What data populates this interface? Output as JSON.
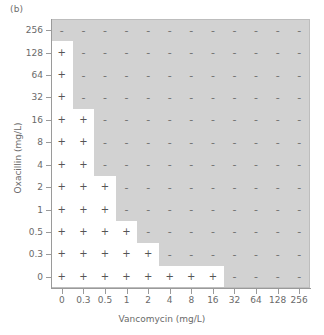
{
  "panel": {
    "label": "(b)"
  },
  "axes": {
    "x": {
      "title": "Vancomycin (mg/L)",
      "ticks": [
        "0",
        "0.3",
        "0.5",
        "1",
        "2",
        "4",
        "8",
        "16",
        "32",
        "64",
        "128",
        "256"
      ]
    },
    "y": {
      "title": "Oxacillin (mg/L)",
      "ticks": [
        "256",
        "128",
        "64",
        "32",
        "16",
        "8",
        "4",
        "2",
        "1",
        "0.5",
        "0.3",
        "0"
      ]
    }
  },
  "legend": {
    "growth_symbol": "+",
    "nogrowth_symbol": "-",
    "growth_fill": "#ffffff",
    "nogrowth_fill": "#d2d2d2"
  },
  "chart_data": {
    "type": "heatmap",
    "title": "(b)",
    "xlabel": "Vancomycin (mg/L)",
    "ylabel": "Oxacillin (mg/L)",
    "x": [
      "0",
      "0.3",
      "0.5",
      "1",
      "2",
      "4",
      "8",
      "16",
      "32",
      "64",
      "128",
      "256"
    ],
    "y": [
      "256",
      "128",
      "64",
      "32",
      "16",
      "8",
      "4",
      "2",
      "1",
      "0.5",
      "0.3",
      "0"
    ],
    "y_order": "top-to-bottom",
    "value_legend": {
      "1": "growth (+), white cell",
      "0": "no growth (-), grey cell"
    },
    "grid": false,
    "legend_position": "none",
    "growth_counts_per_row": [
      0,
      1,
      1,
      1,
      2,
      2,
      2,
      3,
      3,
      4,
      5,
      8
    ],
    "matrix": [
      [
        0,
        0,
        0,
        0,
        0,
        0,
        0,
        0,
        0,
        0,
        0,
        0
      ],
      [
        1,
        0,
        0,
        0,
        0,
        0,
        0,
        0,
        0,
        0,
        0,
        0
      ],
      [
        1,
        0,
        0,
        0,
        0,
        0,
        0,
        0,
        0,
        0,
        0,
        0
      ],
      [
        1,
        0,
        0,
        0,
        0,
        0,
        0,
        0,
        0,
        0,
        0,
        0
      ],
      [
        1,
        1,
        0,
        0,
        0,
        0,
        0,
        0,
        0,
        0,
        0,
        0
      ],
      [
        1,
        1,
        0,
        0,
        0,
        0,
        0,
        0,
        0,
        0,
        0,
        0
      ],
      [
        1,
        1,
        0,
        0,
        0,
        0,
        0,
        0,
        0,
        0,
        0,
        0
      ],
      [
        1,
        1,
        1,
        0,
        0,
        0,
        0,
        0,
        0,
        0,
        0,
        0
      ],
      [
        1,
        1,
        1,
        0,
        0,
        0,
        0,
        0,
        0,
        0,
        0,
        0
      ],
      [
        1,
        1,
        1,
        1,
        0,
        0,
        0,
        0,
        0,
        0,
        0,
        0
      ],
      [
        1,
        1,
        1,
        1,
        1,
        0,
        0,
        0,
        0,
        0,
        0,
        0
      ],
      [
        1,
        1,
        1,
        1,
        1,
        1,
        1,
        1,
        0,
        0,
        0,
        0
      ]
    ]
  }
}
